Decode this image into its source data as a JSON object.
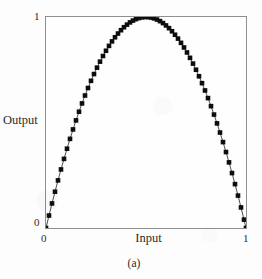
{
  "figure": {
    "caption": "(a)"
  },
  "chart_data": {
    "type": "line",
    "title": "",
    "subtitle": "",
    "xlabel": "Input",
    "ylabel": "Output",
    "xlim": [
      0,
      1
    ],
    "ylim": [
      0,
      1
    ],
    "xticks": [
      0,
      1
    ],
    "xticklabels": [
      "0",
      "1"
    ],
    "yticks": [
      0,
      1
    ],
    "yticklabels": [
      "0",
      "1"
    ],
    "grid": false,
    "legend": null,
    "legend_position": "none",
    "annotations": [],
    "marker": "square",
    "marker_color": "#0d0d0d",
    "line_color": "#3a3a3a",
    "frame_color": "#8d8f91",
    "background_color": "#fefefe",
    "series": [
      {
        "name": "Output vs Input",
        "x": [
          0.0,
          0.015,
          0.03,
          0.045,
          0.06,
          0.075,
          0.09,
          0.105,
          0.12,
          0.135,
          0.15,
          0.165,
          0.18,
          0.195,
          0.21,
          0.225,
          0.24,
          0.255,
          0.27,
          0.285,
          0.3,
          0.315,
          0.33,
          0.345,
          0.36,
          0.375,
          0.39,
          0.405,
          0.42,
          0.435,
          0.45,
          0.465,
          0.48,
          0.495,
          0.51,
          0.525,
          0.54,
          0.555,
          0.57,
          0.585,
          0.6,
          0.615,
          0.63,
          0.645,
          0.66,
          0.675,
          0.69,
          0.705,
          0.72,
          0.735,
          0.75,
          0.765,
          0.78,
          0.795,
          0.81,
          0.825,
          0.84,
          0.855,
          0.87,
          0.885,
          0.9,
          0.915,
          0.93,
          0.945,
          0.96,
          0.975,
          0.99,
          1.0
        ],
        "y": [
          0.0,
          0.0591,
          0.1164,
          0.1719,
          0.2256,
          0.2775,
          0.3276,
          0.3759,
          0.4224,
          0.4671,
          0.51,
          0.5511,
          0.5904,
          0.6279,
          0.6636,
          0.6975,
          0.7296,
          0.7599,
          0.7884,
          0.8151,
          0.84,
          0.8631,
          0.8844,
          0.9039,
          0.9216,
          0.9375,
          0.9516,
          0.9639,
          0.9744,
          0.9831,
          0.99,
          0.9951,
          0.9984,
          0.9999,
          0.9996,
          0.9975,
          0.9936,
          0.9879,
          0.9804,
          0.9711,
          0.96,
          0.9471,
          0.9324,
          0.9159,
          0.8976,
          0.8775,
          0.8556,
          0.8319,
          0.8064,
          0.7791,
          0.75,
          0.7191,
          0.6864,
          0.6519,
          0.6156,
          0.5775,
          0.5376,
          0.4959,
          0.4524,
          0.4071,
          0.36,
          0.3111,
          0.2604,
          0.2079,
          0.1536,
          0.0975,
          0.0396,
          0.0
        ]
      }
    ]
  }
}
